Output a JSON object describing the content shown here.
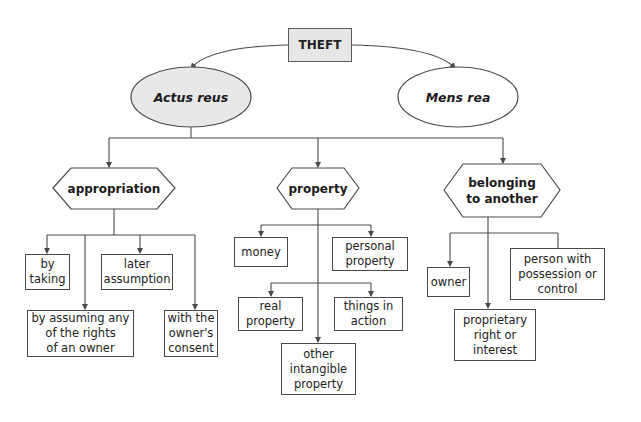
{
  "diagram": {
    "type": "tree",
    "colors": {
      "line": "#4a4a4a",
      "root_fill": "#e6e6e6",
      "actus_reus_fill": "#e8e8e8",
      "box_fill": "#ffffff"
    },
    "root": {
      "label": "THEFT"
    },
    "elements": {
      "actus_reus": {
        "label": "Actus reus"
      },
      "mens_rea": {
        "label": "Mens rea"
      }
    },
    "categories": {
      "appropriation": {
        "label": "appropriation",
        "children": [
          {
            "label": "by taking"
          },
          {
            "label": "later assumption"
          },
          {
            "label": "by assuming any of the rights of an owner"
          },
          {
            "label": "with the owner's consent"
          }
        ]
      },
      "property": {
        "label": "property",
        "children": [
          {
            "label": "money"
          },
          {
            "label": "personal property"
          },
          {
            "label": "real property"
          },
          {
            "label": "things in action"
          },
          {
            "label": "other intangible property"
          }
        ]
      },
      "belonging": {
        "label": "belonging to another",
        "children": [
          {
            "label": "owner"
          },
          {
            "label": "person with possession or control"
          },
          {
            "label": "proprietary right or interest"
          }
        ]
      }
    }
  },
  "text": {
    "theft": "THEFT",
    "actus_reus": "Actus reus",
    "mens_rea": "Mens rea",
    "appropriation": "appropriation",
    "property": "property",
    "belonging_l1": "belonging",
    "belonging_l2": "to another",
    "by_taking_l1": "by",
    "by_taking_l2": "taking",
    "later_l1": "later",
    "later_l2": "assumption",
    "assuming_l1": "by assuming any",
    "assuming_l2": "of the rights",
    "assuming_l3": "of an owner",
    "consent_l1": "with the",
    "consent_l2": "owner's",
    "consent_l3": "consent",
    "money": "money",
    "personal_l1": "personal",
    "personal_l2": "property",
    "real_l1": "real",
    "real_l2": "property",
    "things_l1": "things in",
    "things_l2": "action",
    "other_l1": "other",
    "other_l2": "intangible",
    "other_l3": "property",
    "owner": "owner",
    "person_l1": "person with",
    "person_l2": "possession or",
    "person_l3": "control",
    "proprietary_l1": "proprietary",
    "proprietary_l2": "right or",
    "proprietary_l3": "interest"
  }
}
